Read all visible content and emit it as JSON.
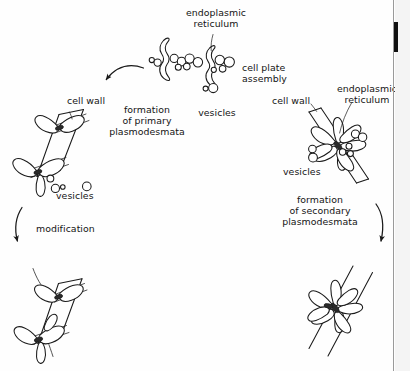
{
  "figure": {
    "background_color": "#fefefe",
    "ink_color": "#1a1a1a",
    "labels": {
      "endoplasmic_reticulum_top": "endoplasmic\nreticulum",
      "cell_plate_assembly": "cell plate\nassembly",
      "vesicles_top": "vesicles",
      "formation_primary": "formation\nof primary\nplasmodesmata",
      "cell_wall_left": "cell wall",
      "vesicles_left": "vesicles",
      "modification": "modification",
      "cell_wall_right": "cell wall",
      "endoplasmic_reticulum_right": "endoplasmic\nreticulum",
      "vesicles_right": "vesicles",
      "formation_secondary": "formation\nof secondary\nplasmodesmata"
    },
    "stages": [
      {
        "id": "cell-plate-assembly",
        "name": "Cell plate assembly",
        "position": "top-center",
        "elements": [
          "endoplasmic reticulum",
          "vesicles"
        ]
      },
      {
        "id": "primary-plasmodesmata",
        "name": "Newly formed primary plasmodesmata in cell wall",
        "position": "left",
        "elements": [
          "cell wall",
          "plasmodesmata",
          "vesicles"
        ]
      },
      {
        "id": "modified-plasmodesmata",
        "name": "Modified primary plasmodesmata",
        "position": "bottom-left",
        "elements": [
          "cell wall",
          "branched plasmodesmata"
        ]
      },
      {
        "id": "secondary-initiation",
        "name": "Secondary plasmodesmata initiation at existing wall",
        "position": "right",
        "elements": [
          "cell wall",
          "endoplasmic reticulum",
          "vesicles"
        ]
      },
      {
        "id": "secondary-plasmodesmata",
        "name": "Formed secondary plasmodesmata",
        "position": "bottom-right",
        "elements": [
          "cell wall",
          "branched plasmodesmata"
        ]
      }
    ],
    "arrows": [
      {
        "id": "arrow-assembly-to-primary",
        "from": "cell-plate-assembly",
        "to": "primary-plasmodesmata",
        "direction": "down-left",
        "style": "curved"
      },
      {
        "id": "arrow-modification",
        "from": "primary-plasmodesmata",
        "to": "modified-plasmodesmata",
        "direction": "down",
        "style": "curved"
      },
      {
        "id": "arrow-secondary",
        "from": "secondary-initiation",
        "to": "secondary-plasmodesmata",
        "direction": "down",
        "style": "curved"
      }
    ]
  }
}
